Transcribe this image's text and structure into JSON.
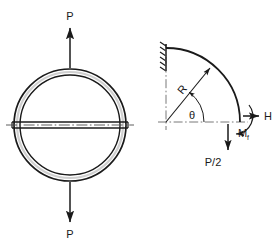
{
  "figure": {
    "title_absent": true,
    "background_color": "#ffffff",
    "line_color": "#1a1a1a",
    "centerline_color": "#555555",
    "panels": [
      {
        "id": "left-panel",
        "name": "ring-under-diametral-tension",
        "description": "Thin circular ring loaded by two opposite radial forces P with a horizontal diametral member",
        "geometry": {
          "center_x": 70,
          "center_y": 125,
          "outer_radius": 56,
          "inner_radius": 50,
          "bar_half_thickness": 3,
          "bar_left_x": 12,
          "bar_right_x": 128
        },
        "labels": [
          {
            "key": "load_top",
            "text": "P",
            "x": 70,
            "y": 20
          },
          {
            "key": "load_bottom",
            "text": "P",
            "x": 70,
            "y": 236
          }
        ],
        "arrows": [
          {
            "key": "arrow-up-P",
            "direction": "up",
            "x": 70,
            "from_y": 68,
            "to_y": 26
          },
          {
            "key": "arrow-down-P",
            "direction": "down",
            "x": 70,
            "from_y": 182,
            "to_y": 224
          }
        ]
      },
      {
        "id": "right-panel",
        "name": "quarter-arc-free-body-diagram",
        "description": "Quarter circular arc fixed at top with radius R, polar angle theta, and end forces H, Mf and P/2",
        "geometry": {
          "origin_x": 166,
          "origin_y": 122,
          "radius": 74,
          "arc_start_angle_deg": 90,
          "arc_end_angle_deg": 0,
          "theta_shown_deg": 52
        },
        "labels": [
          {
            "key": "radius",
            "text": "R",
            "x": 189,
            "y": 86,
            "rotation_deg": -50
          },
          {
            "key": "angle",
            "text": "θ",
            "x": 186,
            "y": 117
          },
          {
            "key": "horizontal_force",
            "text": "H",
            "x": 265,
            "y": 118
          },
          {
            "key": "moment",
            "text": "M",
            "x": 238,
            "y": 133
          },
          {
            "key": "moment_subscript",
            "text": "f",
            "x": 246,
            "y": 136
          },
          {
            "key": "vertical_force",
            "text": "P/2",
            "x": 213,
            "y": 162
          }
        ],
        "support": {
          "key": "fixed-support-hatching",
          "x": 166,
          "y_top": 44,
          "y_bottom": 70,
          "hatch_count": 6
        },
        "arrows": [
          {
            "key": "arrow-R-radius",
            "direction": "outward-upper-right"
          },
          {
            "key": "arrow-theta-angle",
            "direction": "counterclockwise-arc"
          },
          {
            "key": "arrow-H-right",
            "direction": "right"
          },
          {
            "key": "arrow-Mf-moment",
            "direction": "curved-clockwise"
          },
          {
            "key": "arrow-P2-down",
            "direction": "down"
          }
        ]
      }
    ]
  }
}
